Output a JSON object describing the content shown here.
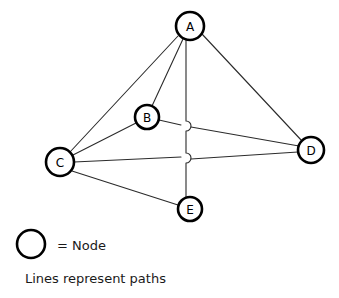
{
  "diagram": {
    "background_color": "#ffffff",
    "line_color": "#2b2b2b",
    "node_stroke_color": "#000000",
    "node_fill_color": "#ffffff",
    "text_color": "#1a1a1a",
    "nodes": [
      {
        "id": "A",
        "label": "A",
        "cx": 190,
        "cy": 26,
        "r": 14
      },
      {
        "id": "B",
        "label": "B",
        "cx": 147,
        "cy": 117,
        "r": 12
      },
      {
        "id": "C",
        "label": "C",
        "cx": 60,
        "cy": 162,
        "r": 14
      },
      {
        "id": "D",
        "label": "D",
        "cx": 311,
        "cy": 150,
        "r": 13
      },
      {
        "id": "E",
        "label": "E",
        "cx": 190,
        "cy": 209,
        "r": 12
      }
    ],
    "edges": [
      {
        "from": "A",
        "to": "B",
        "kind": "straight"
      },
      {
        "from": "A",
        "to": "C",
        "kind": "straight"
      },
      {
        "from": "A",
        "to": "D",
        "kind": "straight"
      },
      {
        "from": "A",
        "to": "E",
        "kind": "hopped-vertical"
      },
      {
        "from": "B",
        "to": "C",
        "kind": "straight"
      },
      {
        "from": "B",
        "to": "D",
        "kind": "straight"
      },
      {
        "from": "C",
        "to": "D",
        "kind": "straight"
      },
      {
        "from": "C",
        "to": "E",
        "kind": "straight"
      }
    ],
    "crossing_hops": [
      {
        "on_edge": "A-E",
        "crosses": "B-D",
        "x": 186,
        "y": 126
      },
      {
        "on_edge": "A-E",
        "crosses": "C-D",
        "x": 186,
        "y": 158
      }
    ]
  },
  "legend": {
    "node_symbol": "node-circle-symbol",
    "node_text": "= Node",
    "caption": "Lines represent paths",
    "circle": {
      "cx": 31,
      "cy": 244,
      "r": 14
    },
    "node_text_x": 57,
    "node_text_y": 245,
    "caption_x": 25,
    "caption_y": 278
  }
}
